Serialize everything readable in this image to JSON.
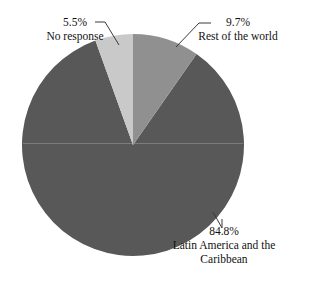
{
  "chart_data": {
    "type": "pie",
    "title": "",
    "legend_position": "none",
    "categories": [
      "Rest of the world",
      "Latin America and the Caribbean",
      "No response"
    ],
    "values": [
      9.7,
      84.8,
      5.5
    ],
    "value_labels": [
      "9.7%",
      "84.8%",
      "5.5%"
    ],
    "units": "percent",
    "start_angle_deg": 0,
    "direction": "clockwise",
    "slices": [
      {
        "label": "Rest of the world",
        "value": 9.7,
        "value_label": "9.7%",
        "color": "#909090",
        "start_angle_deg": 0,
        "end_angle_deg": 34.92
      },
      {
        "label": "Latin America and the Caribbean",
        "value": 84.8,
        "value_label": "84.8%",
        "color": "#585858",
        "start_angle_deg": 34.92,
        "end_angle_deg": 340.2
      },
      {
        "label": "No response",
        "value": 5.5,
        "value_label": "5.5%",
        "color": "#c9c9c9",
        "start_angle_deg": 340.2,
        "end_angle_deg": 360
      }
    ]
  },
  "labels": {
    "no_response": {
      "percent": "5.5%",
      "name": "No response"
    },
    "rest_of_world": {
      "percent": "9.7%",
      "name": "Rest of the world"
    },
    "latin_america": {
      "percent": "84.8%",
      "name": "Latin America and the Caribbean"
    }
  },
  "colors": {
    "background": "#ffffff",
    "slice_no_response": "#c9c9c9",
    "slice_rest_of_world": "#909090",
    "slice_latin_america": "#585858",
    "leader_line": "#3a3a3a",
    "text": "#111111"
  },
  "geometry": {
    "center_x": 133,
    "center_y": 145,
    "radius": 111
  }
}
